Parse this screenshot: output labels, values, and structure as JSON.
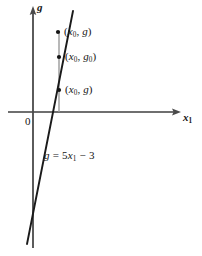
{
  "figure": {
    "width": 202,
    "height": 256,
    "background": "#ffffff",
    "ink_color": "#141414",
    "dropline_color": "#9a9a9a"
  },
  "axes": {
    "y_axis": {
      "name": "g",
      "label_html": "<i>g</i>",
      "x": 33,
      "y_top": 8,
      "y_bottom": 248,
      "arrow": "up",
      "label_pos": {
        "x": 37,
        "y": 4
      }
    },
    "x_axis": {
      "name": "x1",
      "label_html": "<i>x</i><sub>1</sub>",
      "y": 112,
      "x_left": 8,
      "x_right": 181,
      "arrow": "right",
      "label_pos": {
        "x": 183,
        "y": 115
      }
    },
    "origin": {
      "label": "0",
      "pos": {
        "x": 25,
        "y": 117
      }
    }
  },
  "chart_data": {
    "type": "line",
    "title": "",
    "xlabel": "x_1",
    "ylabel": "g",
    "grid": false,
    "legend": null,
    "series": [
      {
        "name": "g = 5x_1 - 3",
        "equation_html": "<i>g</i> = 5<i>x</i><sub>1</sub> &minus; 3",
        "slope": 5,
        "intercept": -3,
        "style": "solid",
        "color": "#141414",
        "x_intercept": 0.6,
        "pixel_endpoints": [
          {
            "x": 73,
            "y": 11
          },
          {
            "x": 27,
            "y": 244
          }
        ]
      }
    ],
    "points": [
      {
        "id": "upper",
        "label_html": "(<i>x</i><sub>0</sub>, <i>g</i>)",
        "pixel": {
          "x": 58,
          "y": 32
        },
        "label_pos": {
          "x": 64,
          "y": 26
        }
      },
      {
        "id": "middle",
        "label_html": "(<i>x</i><sub>0</sub>, <i>g</i><sub>0</sub>)",
        "pixel": {
          "x": 59,
          "y": 57
        },
        "label_pos": {
          "x": 65,
          "y": 51
        }
      },
      {
        "id": "lower",
        "label_html": "(<i>x</i><sub>0</sub>, <i>g</i>)",
        "pixel": {
          "x": 59,
          "y": 90
        },
        "label_pos": {
          "x": 65,
          "y": 84
        }
      }
    ],
    "dropline": {
      "x": 59,
      "y_top": 32,
      "y_bottom": 112,
      "color": "#9a9a9a"
    },
    "annotations": [
      {
        "id": "equation",
        "text_html": "<i>g</i> = 5<i>x</i><sub>1</sub> &minus; 3",
        "pos": {
          "x": 44,
          "y": 150
        }
      }
    ]
  }
}
